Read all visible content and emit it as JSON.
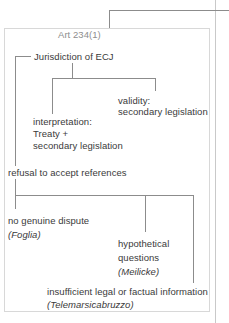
{
  "diagram": {
    "title": "Art 234(1)",
    "root": "Jurisdiction of ECJ",
    "branches": {
      "interpretation": {
        "line1": "interpretation:",
        "line2": "Treaty +",
        "line3": "secondary legislation"
      },
      "validity": {
        "line1": "validity:",
        "line2": "secondary legislation"
      }
    },
    "refusal": {
      "heading": "refusal to accept references",
      "cases": [
        {
          "label": "no genuine dispute",
          "case_name": "(Foglia)"
        },
        {
          "label_line1": "hypothetical",
          "label_line2": "questions",
          "case_name": "(Meilicke)"
        },
        {
          "label": "insufficient legal or factual information",
          "case_name": "(Telemarsicabruzzo)"
        }
      ]
    }
  },
  "colors": {
    "connector": "#8c8c8c",
    "text": "#3a3a3a",
    "muted": "#8e8e8e",
    "card_border": "#d8d8d8",
    "margin_rule": "#c9c9c9"
  }
}
